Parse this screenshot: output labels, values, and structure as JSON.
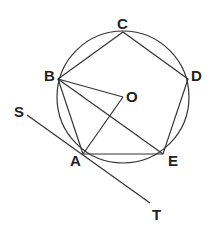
{
  "diagram": {
    "type": "geometry",
    "circle": {
      "cx": 123,
      "cy": 97,
      "r": 66
    },
    "points": {
      "A": {
        "x": 83,
        "y": 154
      },
      "B": {
        "x": 58,
        "y": 79
      },
      "C": {
        "x": 123,
        "y": 32
      },
      "D": {
        "x": 188,
        "y": 79
      },
      "E": {
        "x": 163,
        "y": 154
      },
      "O": {
        "x": 123,
        "y": 97
      },
      "S": {
        "x": 27,
        "y": 115
      },
      "T": {
        "x": 150,
        "y": 203
      }
    },
    "labels": {
      "A": "A",
      "B": "B",
      "C": "C",
      "D": "D",
      "E": "E",
      "O": "O",
      "S": "S",
      "T": "T"
    },
    "segments": [
      "AB",
      "BC",
      "CD",
      "DE",
      "EA",
      "BO",
      "OA",
      "BE",
      "ST"
    ]
  }
}
